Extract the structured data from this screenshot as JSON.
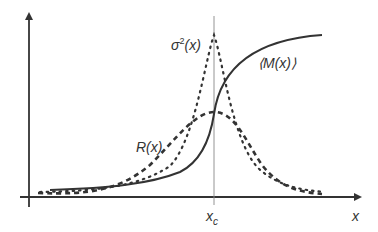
{
  "diagram": {
    "colors": {
      "axes": "#333333",
      "curves": "#333333",
      "critical_line": "#888888",
      "background": "#ffffff"
    },
    "axes": {
      "x_label": "x",
      "y_label": ""
    },
    "critical_point": {
      "label_main": "x",
      "label_sub": "c"
    },
    "curves": [
      {
        "name": "M",
        "label": "⟨M(x)⟩",
        "style": "solid",
        "shape": "sigmoid"
      },
      {
        "name": "sigma2",
        "label_main": "σ",
        "label_sup": "2",
        "label_rest": "(x)",
        "style": "dotted",
        "shape": "sharp peak at x_c"
      },
      {
        "name": "R",
        "label": "R(x)",
        "style": "dashed",
        "shape": "broad bump peaked at x_c"
      }
    ]
  }
}
